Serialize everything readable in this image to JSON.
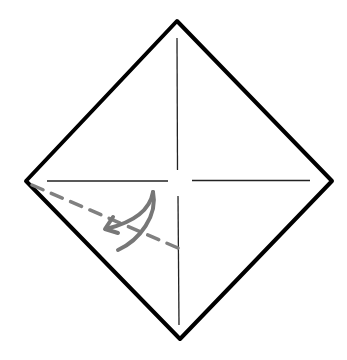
{
  "diagram": {
    "type": "origami-fold-instruction",
    "colors": {
      "background": "#ffffff",
      "outline": "#000000",
      "crease": "#222222",
      "fold_line": "#808080",
      "arrow": "#777777"
    },
    "elements": [
      {
        "name": "paper-outline",
        "shape": "diamond"
      },
      {
        "name": "vertical-crease",
        "shape": "line"
      },
      {
        "name": "horizontal-crease",
        "shape": "line"
      },
      {
        "name": "valley-fold-line",
        "shape": "dashed-line"
      },
      {
        "name": "fold-arrow",
        "shape": "curved-arrow"
      }
    ]
  }
}
